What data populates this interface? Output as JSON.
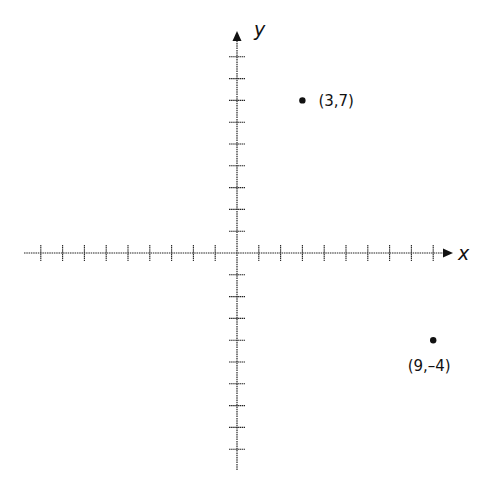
{
  "diagram": {
    "type": "coordinate-plane",
    "axes": {
      "x_label": "x",
      "y_label": "y",
      "x_ticks_negative": 9,
      "x_ticks_positive": 9,
      "y_ticks_positive": 9,
      "y_ticks_negative": 9,
      "unit_px": 21.8,
      "origin_px": [
        237,
        253
      ]
    },
    "points": [
      {
        "x": 3,
        "y": 7,
        "label": "(3,7)",
        "label_position": "right"
      },
      {
        "x": 9,
        "y": -4,
        "label": "(9,–4)",
        "label_position": "below"
      }
    ],
    "colors": {
      "ink": "#111111",
      "background": "#ffffff"
    }
  }
}
